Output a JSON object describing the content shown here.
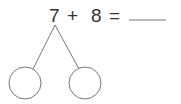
{
  "problem": {
    "addend1": "7",
    "operator": "+",
    "addend2": "8",
    "equals": "=",
    "answer": ""
  },
  "number_bond": {
    "left_part": "",
    "right_part": ""
  },
  "colors": {
    "text": "#333333",
    "lines": "#777777"
  }
}
